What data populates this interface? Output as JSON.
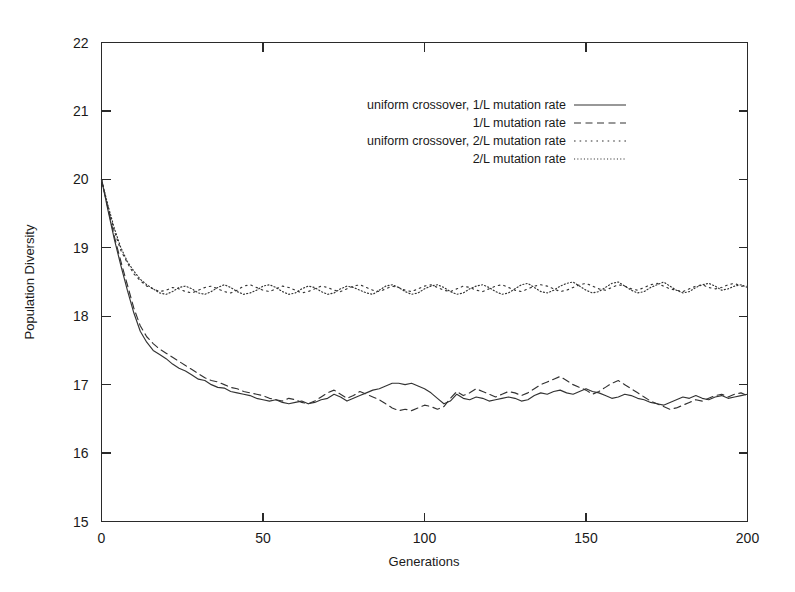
{
  "chart_data": {
    "type": "line",
    "title": "",
    "xlabel": "Generations",
    "ylabel": "Population Diversity",
    "xlim": [
      0,
      200
    ],
    "ylim": [
      15,
      22
    ],
    "xticks": [
      0,
      50,
      100,
      150,
      200
    ],
    "yticks": [
      15,
      16,
      17,
      18,
      19,
      20,
      21,
      22
    ],
    "xtick_labels": [
      "0",
      "50",
      "100",
      "150",
      "200"
    ],
    "ytick_labels": [
      "15",
      "16",
      "17",
      "18",
      "19",
      "20",
      "21",
      "22"
    ],
    "grid": false,
    "legend_position": "upper-center",
    "x": [
      0,
      2,
      4,
      6,
      8,
      10,
      12,
      14,
      16,
      18,
      20,
      22,
      24,
      26,
      28,
      30,
      32,
      34,
      36,
      38,
      40,
      42,
      44,
      46,
      48,
      50,
      52,
      54,
      56,
      58,
      60,
      62,
      64,
      66,
      68,
      70,
      72,
      74,
      76,
      78,
      80,
      82,
      84,
      86,
      88,
      90,
      92,
      94,
      96,
      98,
      100,
      102,
      104,
      106,
      108,
      110,
      112,
      114,
      116,
      118,
      120,
      122,
      124,
      126,
      128,
      130,
      132,
      134,
      136,
      138,
      140,
      142,
      144,
      146,
      148,
      150,
      152,
      154,
      156,
      158,
      160,
      162,
      164,
      166,
      168,
      170,
      172,
      174,
      176,
      178,
      180,
      182,
      184,
      186,
      188,
      190,
      192,
      194,
      196,
      198,
      200
    ],
    "series": [
      {
        "name": "uniform crossover, 1/L mutation rate",
        "style": "solid",
        "values": [
          20.0,
          19.55,
          19.12,
          18.74,
          18.38,
          18.05,
          17.78,
          17.62,
          17.5,
          17.44,
          17.38,
          17.3,
          17.24,
          17.2,
          17.14,
          17.08,
          17.06,
          17.0,
          16.96,
          16.95,
          16.9,
          16.88,
          16.86,
          16.84,
          16.8,
          16.78,
          16.76,
          16.78,
          16.74,
          16.72,
          16.74,
          16.76,
          16.72,
          16.74,
          16.78,
          16.8,
          16.86,
          16.82,
          16.76,
          16.8,
          16.84,
          16.88,
          16.92,
          16.94,
          16.98,
          17.02,
          17.02,
          17.0,
          17.02,
          16.98,
          16.94,
          16.88,
          16.8,
          16.72,
          16.76,
          16.86,
          16.8,
          16.78,
          16.82,
          16.8,
          16.76,
          16.78,
          16.8,
          16.82,
          16.8,
          16.76,
          16.78,
          16.84,
          16.88,
          16.86,
          16.9,
          16.92,
          16.88,
          16.86,
          16.9,
          16.94,
          16.9,
          16.88,
          16.84,
          16.8,
          16.82,
          16.86,
          16.84,
          16.8,
          16.78,
          16.74,
          16.72,
          16.7,
          16.74,
          16.78,
          16.82,
          16.8,
          16.84,
          16.8,
          16.78,
          16.82,
          16.84,
          16.8,
          16.82,
          16.84,
          16.86
        ]
      },
      {
        "name": "1/L mutation rate",
        "style": "dashed",
        "values": [
          20.0,
          19.58,
          19.16,
          18.8,
          18.46,
          18.12,
          17.86,
          17.7,
          17.6,
          17.52,
          17.46,
          17.4,
          17.34,
          17.28,
          17.22,
          17.16,
          17.1,
          17.06,
          17.04,
          17.0,
          16.96,
          16.94,
          16.9,
          16.88,
          16.86,
          16.84,
          16.8,
          16.78,
          16.76,
          16.8,
          16.78,
          16.74,
          16.72,
          16.76,
          16.82,
          16.88,
          16.92,
          16.86,
          16.8,
          16.84,
          16.9,
          16.86,
          16.82,
          16.78,
          16.72,
          16.66,
          16.62,
          16.64,
          16.62,
          16.66,
          16.7,
          16.68,
          16.64,
          16.68,
          16.8,
          16.9,
          16.84,
          16.88,
          16.94,
          16.9,
          16.86,
          16.82,
          16.86,
          16.9,
          16.88,
          16.84,
          16.88,
          16.94,
          17.0,
          17.04,
          17.08,
          17.12,
          17.06,
          17.0,
          16.96,
          16.92,
          16.86,
          16.9,
          16.96,
          17.02,
          17.06,
          17.0,
          16.94,
          16.88,
          16.82,
          16.76,
          16.72,
          16.68,
          16.64,
          16.66,
          16.7,
          16.74,
          16.78,
          16.76,
          16.8,
          16.84,
          16.86,
          16.82,
          16.86,
          16.88,
          16.84
        ]
      },
      {
        "name": "uniform crossover, 2/L mutation rate",
        "style": "dotted",
        "values": [
          20.0,
          19.6,
          19.24,
          18.96,
          18.78,
          18.62,
          18.52,
          18.44,
          18.4,
          18.36,
          18.38,
          18.42,
          18.4,
          18.36,
          18.34,
          18.38,
          18.42,
          18.44,
          18.4,
          18.36,
          18.34,
          18.38,
          18.44,
          18.46,
          18.42,
          18.38,
          18.36,
          18.4,
          18.44,
          18.42,
          18.38,
          18.34,
          18.36,
          18.4,
          18.44,
          18.42,
          18.38,
          18.36,
          18.4,
          18.44,
          18.46,
          18.42,
          18.38,
          18.36,
          18.4,
          18.44,
          18.42,
          18.38,
          18.36,
          18.4,
          18.44,
          18.46,
          18.42,
          18.38,
          18.36,
          18.4,
          18.44,
          18.42,
          18.38,
          18.36,
          18.4,
          18.44,
          18.46,
          18.42,
          18.38,
          18.36,
          18.4,
          18.44,
          18.46,
          18.44,
          18.4,
          18.36,
          18.38,
          18.42,
          18.46,
          18.48,
          18.44,
          18.4,
          18.38,
          18.42,
          18.46,
          18.44,
          18.4,
          18.38,
          18.42,
          18.46,
          18.48,
          18.44,
          18.4,
          18.38,
          18.36,
          18.4,
          18.44,
          18.46,
          18.42,
          18.4,
          18.42,
          18.46,
          18.48,
          18.44,
          18.44
        ]
      },
      {
        "name": "2/L mutation rate",
        "style": "fine-dotted",
        "values": [
          20.0,
          19.62,
          19.28,
          19.0,
          18.8,
          18.66,
          18.54,
          18.46,
          18.4,
          18.34,
          18.32,
          18.36,
          18.42,
          18.44,
          18.4,
          18.34,
          18.32,
          18.36,
          18.42,
          18.46,
          18.42,
          18.36,
          18.32,
          18.34,
          18.38,
          18.44,
          18.46,
          18.42,
          18.36,
          18.32,
          18.34,
          18.4,
          18.44,
          18.42,
          18.36,
          18.32,
          18.34,
          18.4,
          18.44,
          18.42,
          18.38,
          18.34,
          18.32,
          18.38,
          18.44,
          18.46,
          18.42,
          18.36,
          18.32,
          18.34,
          18.4,
          18.44,
          18.46,
          18.42,
          18.36,
          18.32,
          18.34,
          18.4,
          18.44,
          18.46,
          18.42,
          18.36,
          18.32,
          18.34,
          18.4,
          18.46,
          18.48,
          18.42,
          18.36,
          18.34,
          18.38,
          18.44,
          18.48,
          18.5,
          18.44,
          18.38,
          18.34,
          18.36,
          18.42,
          18.48,
          18.5,
          18.44,
          18.38,
          18.34,
          18.36,
          18.42,
          18.46,
          18.5,
          18.44,
          18.38,
          18.34,
          18.36,
          18.42,
          18.46,
          18.48,
          18.44,
          18.38,
          18.4,
          18.44,
          18.46,
          18.42
        ]
      }
    ],
    "legend": [
      {
        "label": "uniform crossover, 1/L mutation rate",
        "style": "solid"
      },
      {
        "label": "1/L mutation rate",
        "style": "dashed"
      },
      {
        "label": "uniform crossover, 2/L mutation rate",
        "style": "dotted"
      },
      {
        "label": "2/L mutation rate",
        "style": "fine-dotted"
      }
    ]
  },
  "colors": {
    "background": "#ffffff",
    "axis": "#2a2a2a",
    "line": "#333333",
    "text": "#1a1a1a"
  }
}
